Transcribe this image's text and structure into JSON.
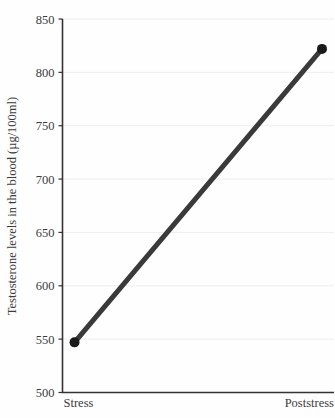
{
  "chart_data": {
    "type": "line",
    "title": "",
    "xlabel": "",
    "ylabel": "Testosterone levels in the blood (µg/100ml)",
    "categories": [
      "Stress",
      "Poststress"
    ],
    "values": [
      547,
      822
    ],
    "series": [
      {
        "name": "Testosterone",
        "values": [
          547,
          822
        ]
      }
    ],
    "ylim": [
      500,
      850
    ],
    "yticks": [
      500,
      550,
      600,
      650,
      700,
      750,
      800,
      850
    ],
    "ytick_labels": [
      "500",
      "550",
      "600",
      "650",
      "700",
      "750",
      "800",
      "850"
    ],
    "grid": true,
    "legend": "none",
    "line_color": "#3a3a3a",
    "marker_color": "#1a1a1a",
    "grid_color": "#eeeeee",
    "axis_color": "#333333",
    "background_color": "#fefefe"
  },
  "axes": {
    "y_title": "Testosterone levels in the blood (µg/100ml)",
    "y_ticks": [
      "500",
      "550",
      "600",
      "650",
      "700",
      "750",
      "800",
      "850"
    ],
    "x_categories": [
      "Stress",
      "Poststress"
    ]
  }
}
